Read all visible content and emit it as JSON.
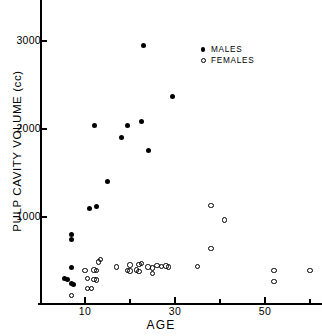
{
  "chart_data": {
    "type": "scatter",
    "title": "",
    "xlabel": "AGE",
    "ylabel": "PULP CAVITY VOLUME (cc)",
    "xlim": [
      4,
      63
    ],
    "ylim": [
      0,
      3400
    ],
    "xticks": [
      10,
      30,
      50
    ],
    "xminorticks": [
      20,
      40,
      60
    ],
    "yticks": [
      1000,
      2000,
      3000
    ],
    "grid": false,
    "legend_position": "upper-right",
    "series": [
      {
        "name": "MALES",
        "marker": "filled-circle",
        "color": "#000000",
        "points": [
          [
            23,
            2950
          ],
          [
            29.5,
            2370
          ],
          [
            22.5,
            2085
          ],
          [
            12,
            2045
          ],
          [
            19.5,
            2040
          ],
          [
            18,
            1905
          ],
          [
            24,
            1760
          ],
          [
            15,
            1400
          ],
          [
            12.5,
            1125
          ],
          [
            11,
            1095
          ],
          [
            7,
            805
          ],
          [
            7,
            740
          ],
          [
            7,
            430
          ],
          [
            5.5,
            300
          ],
          [
            6,
            285
          ],
          [
            7,
            250
          ],
          [
            7.5,
            235
          ]
        ]
      },
      {
        "name": "FEMALES",
        "marker": "open-circle",
        "color": "#000000",
        "points": [
          [
            38,
            1130
          ],
          [
            41,
            965
          ],
          [
            38,
            640
          ],
          [
            35,
            440
          ],
          [
            52,
            395
          ],
          [
            52,
            270
          ],
          [
            60,
            390
          ],
          [
            13.5,
            515
          ],
          [
            13,
            490
          ],
          [
            22.5,
            470
          ],
          [
            22,
            460
          ],
          [
            20,
            455
          ],
          [
            26,
            450
          ],
          [
            27,
            440
          ],
          [
            28,
            445
          ],
          [
            28.5,
            430
          ],
          [
            24,
            430
          ],
          [
            25,
            420
          ],
          [
            21.5,
            400
          ],
          [
            19.5,
            395
          ],
          [
            17,
            430
          ],
          [
            20,
            385
          ],
          [
            22,
            380
          ],
          [
            25,
            355
          ],
          [
            12,
            400
          ],
          [
            12.5,
            390
          ],
          [
            10,
            390
          ],
          [
            10.5,
            300
          ],
          [
            12,
            290
          ],
          [
            12.5,
            285
          ],
          [
            10.5,
            185
          ],
          [
            11.5,
            190
          ],
          [
            7,
            110
          ]
        ]
      }
    ]
  },
  "legend": {
    "items": [
      {
        "label": "MALES",
        "marker": "filled-circle"
      },
      {
        "label": "FEMALES",
        "marker": "open-circle"
      }
    ]
  }
}
